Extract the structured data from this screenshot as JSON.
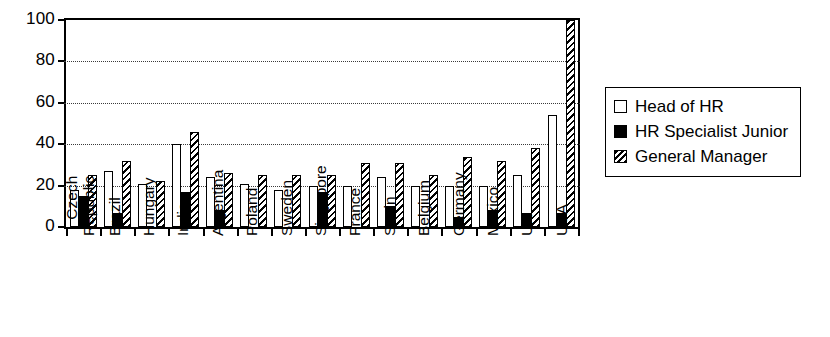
{
  "chart_data": {
    "type": "bar",
    "title": "",
    "subtitle": "",
    "xlabel": "",
    "ylabel": "",
    "ylim": [
      0,
      100
    ],
    "yticks": [
      0,
      20,
      40,
      60,
      80,
      100
    ],
    "grid": "horizontal dotted gridlines at 20, 40, 60, 80",
    "legend_position": "right",
    "categories": [
      "Czech Republic",
      "Brazil",
      "Hungary",
      "India",
      "Argentina",
      "Poland",
      "Sweden",
      "Singapore",
      "France",
      "Spain",
      "Belgium",
      "Germany",
      "Mexico",
      "UK",
      "USA"
    ],
    "series": [
      {
        "name": "Head of HR",
        "fill": "white",
        "values": [
          18,
          27,
          21,
          40,
          24,
          21,
          18,
          20,
          20,
          24,
          20,
          20,
          20,
          25,
          54
        ]
      },
      {
        "name": "HR Specialist Junior",
        "fill": "solid-black",
        "values": [
          15,
          7,
          0,
          17,
          8,
          0,
          0,
          17,
          0,
          10,
          0,
          5,
          8,
          7,
          7
        ]
      },
      {
        "name": "General Manager",
        "fill": "diagonal-hatch",
        "values": [
          25,
          32,
          22,
          46,
          26,
          25,
          25,
          25,
          31,
          31,
          25,
          34,
          32,
          38,
          100
        ]
      }
    ]
  },
  "legend": {
    "items": [
      {
        "label": "Head of HR"
      },
      {
        "label": "HR Specialist Junior"
      },
      {
        "label": "General Manager"
      }
    ]
  },
  "colors": {
    "axis": "#000000",
    "gridline": "#3a3a3a",
    "series_head_of_hr": "#ffffff",
    "series_hr_specialist_junior": "#000000",
    "series_general_manager": "#000000",
    "background": "#ffffff"
  }
}
